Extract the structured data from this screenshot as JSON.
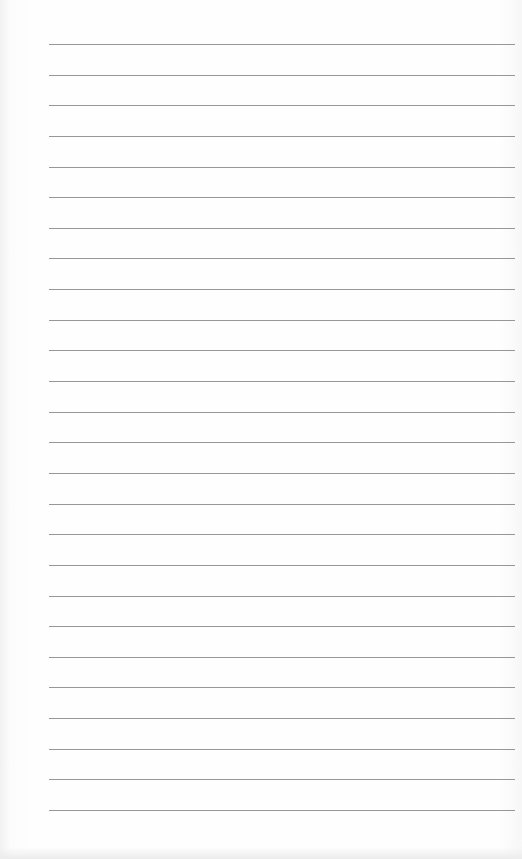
{
  "paper": {
    "background_color": "#fdfdfd",
    "line_color": "#8c8c8c",
    "line_count": 26,
    "first_line_y": 44,
    "line_spacing": 30.64,
    "line_left": 49,
    "line_right": 515
  }
}
